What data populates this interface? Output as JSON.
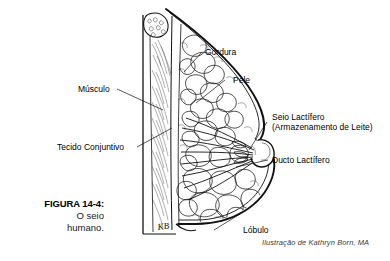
{
  "figure": {
    "caption_label": "FIGURA 14-4:",
    "caption_line1": "O seio",
    "caption_line2": "humano.",
    "credit": "Ilustração de Kathryn Born, MA",
    "artist_signature": "KB",
    "background_color": "#ffffff",
    "ink_color": "#1a1a1a"
  },
  "labels": {
    "gordura": "Gordura",
    "pele": "Pele",
    "musculo": "Músculo",
    "tecido_conjuntivo": "Tecido Conjuntivo",
    "seio_lactifero_line1": "Seio Lactífero",
    "seio_lactifero_line2": "(Armazenamento de Leite)",
    "ducto_lactifero": "Ducto Lactífero",
    "lobulo": "Lóbulo"
  },
  "diagram_data": {
    "type": "anatomical-cross-section",
    "subject": "human breast sagittal cross-section",
    "structures": [
      "Gordura",
      "Pele",
      "Músculo",
      "Tecido Conjuntivo",
      "Seio Lactífero (Armazenamento de Leite)",
      "Ducto Lactífero",
      "Lóbulo"
    ]
  }
}
